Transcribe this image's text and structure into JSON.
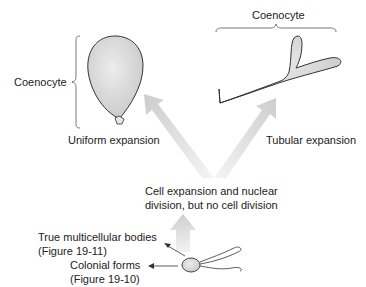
{
  "labels": {
    "coenocyte_left": "Coenocyte",
    "coenocyte_top": "Coenocyte",
    "uniform_expansion": "Uniform expansion",
    "tubular_expansion": "Tubular expansion",
    "center_line1": "Cell expansion and nuclear",
    "center_line2": "division, but no cell division",
    "multicellular_line1": "True multicellular bodies",
    "multicellular_line2": "(Figure 19-11)",
    "colonial_line1": "Colonial forms",
    "colonial_line2": "(Figure 19-10)"
  },
  "colors": {
    "arrow_fill": "#d9d9d9",
    "cell_fill": "#d4d4d4",
    "outline": "#333333",
    "text": "#222222"
  }
}
